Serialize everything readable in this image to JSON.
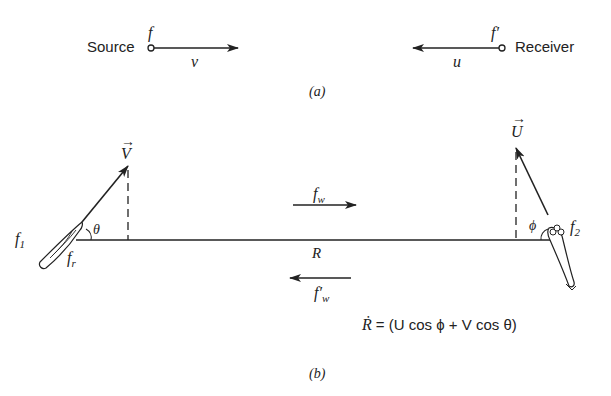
{
  "part_a": {
    "source_label": "Source",
    "source_freq": "f",
    "source_velocity": "v",
    "receiver_label": "Receiver",
    "receiver_freq": "f′",
    "receiver_velocity": "u",
    "caption": "(a)"
  },
  "part_b": {
    "vessel1_freq": "f",
    "vessel1_freq_sub": "1",
    "vessel1_reflected": "f",
    "vessel1_reflected_sub": "r",
    "vessel1_velocity": "V",
    "vessel1_angle": "θ",
    "vessel2_freq": "f",
    "vessel2_freq_sub": "2",
    "vessel2_velocity": "U",
    "vessel2_angle": "ϕ",
    "forward_wave": "f",
    "forward_wave_sub": "w",
    "return_wave": "f′",
    "return_wave_sub": "w",
    "range_label": "R",
    "equation_lhs": "Ṙ",
    "equation_rhs": "= (U  cos ϕ + V cos θ)",
    "caption": "(b)"
  },
  "colors": {
    "ink": "#222222",
    "background": "#ffffff"
  }
}
